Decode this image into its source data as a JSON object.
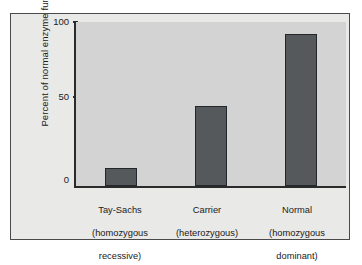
{
  "figure": {
    "background_color": "#ffffff",
    "panel_background_color": "#e9e9e7",
    "plot_background_color": "#d3d3d3",
    "bar_color": "#56595b",
    "axis_color": "#2a2a2a"
  },
  "chart_data": {
    "type": "bar",
    "title": "",
    "xlabel": "",
    "ylabel": "Percent of normal enzyme function",
    "ylim": [
      0,
      110
    ],
    "yticks": [
      0,
      50,
      100
    ],
    "ytick_labels": [
      "0",
      "50",
      "100"
    ],
    "grid": false,
    "legend": null,
    "categories": [
      "Tay-Sachs\n(homozygous\nrecessive)",
      "Carrier\n(heterozygous)",
      "Normal\n(homozygous\ndominant)"
    ],
    "category_lines": [
      [
        "Tay-Sachs",
        "(homozygous",
        "recessive)"
      ],
      [
        "Carrier",
        "(heterozygous)"
      ],
      [
        "Normal",
        "(homozygous",
        "dominant)"
      ]
    ],
    "values": [
      12,
      54,
      102
    ],
    "bar_color": "#56595b"
  },
  "axis": {
    "y_label": "Percent of normal enzyme function",
    "tick_100": "100",
    "tick_50": "50",
    "tick_0": "0"
  },
  "labels": {
    "cat1_line1": "Tay-Sachs",
    "cat1_line2": "(homozygous",
    "cat1_line3": "recessive)",
    "cat2_line1": "Carrier",
    "cat2_line2": "(heterozygous)",
    "cat3_line1": "Normal",
    "cat3_line2": "(homozygous",
    "cat3_line3": "dominant)"
  }
}
